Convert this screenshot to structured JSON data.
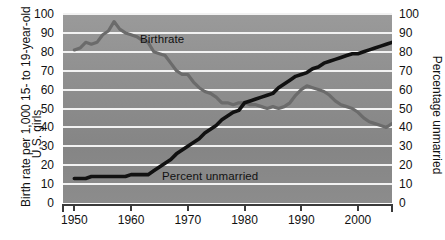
{
  "chart_data": {
    "type": "line",
    "title": "",
    "xlabel": "",
    "ylabel": "Birth rate per 1,000 15- to 19-year-old U.S. girls",
    "ylabel_line1": "Birth rate per 1,000 15- to 19-year-old",
    "ylabel_line2": "U.S. girls",
    "y2label": "Percentage unmarried",
    "xlim": [
      1948,
      2006
    ],
    "ylim": [
      0,
      100
    ],
    "y2lim": [
      0,
      100
    ],
    "grid": true,
    "legend_position": "inline",
    "xticks": [
      1950,
      1960,
      1970,
      1980,
      1990,
      2000
    ],
    "yticks": [
      0,
      10,
      20,
      30,
      40,
      50,
      60,
      70,
      80,
      90,
      100
    ],
    "y2ticks": [
      0,
      10,
      20,
      30,
      40,
      50,
      60,
      70,
      80,
      90,
      100
    ],
    "series": [
      {
        "name": "Birthrate",
        "color": "#6b6b6b",
        "axis": "left",
        "x": [
          1950,
          1951,
          1952,
          1953,
          1954,
          1955,
          1956,
          1957,
          1958,
          1959,
          1960,
          1961,
          1962,
          1963,
          1964,
          1965,
          1966,
          1967,
          1968,
          1969,
          1970,
          1971,
          1972,
          1973,
          1974,
          1975,
          1976,
          1977,
          1978,
          1979,
          1980,
          1981,
          1982,
          1983,
          1984,
          1985,
          1986,
          1987,
          1988,
          1989,
          1990,
          1991,
          1992,
          1993,
          1994,
          1995,
          1996,
          1997,
          1998,
          1999,
          2000,
          2001,
          2002,
          2003,
          2004,
          2005,
          2006
        ],
        "values": [
          81,
          82,
          85,
          84,
          85,
          89,
          91,
          96,
          92,
          90,
          89,
          88,
          86,
          85,
          80,
          79,
          78,
          74,
          70,
          68,
          68,
          64,
          61,
          59,
          58,
          56,
          53,
          53,
          52,
          53,
          53,
          52,
          52,
          51,
          50,
          51,
          50,
          51,
          53,
          57,
          60,
          62,
          61,
          60,
          59,
          57,
          54,
          52,
          51,
          50,
          48,
          45,
          43,
          42,
          41,
          40,
          42
        ]
      },
      {
        "name": "Percent unmarried",
        "color": "#111111",
        "axis": "right",
        "x": [
          1950,
          1951,
          1952,
          1953,
          1954,
          1955,
          1956,
          1957,
          1958,
          1959,
          1960,
          1961,
          1962,
          1963,
          1964,
          1965,
          1966,
          1967,
          1968,
          1969,
          1970,
          1971,
          1972,
          1973,
          1974,
          1975,
          1976,
          1977,
          1978,
          1979,
          1980,
          1981,
          1982,
          1983,
          1984,
          1985,
          1986,
          1987,
          1988,
          1989,
          1990,
          1991,
          1992,
          1993,
          1994,
          1995,
          1996,
          1997,
          1998,
          1999,
          2000,
          2001,
          2002,
          2003,
          2004,
          2005,
          2006
        ],
        "values": [
          13,
          13,
          13,
          14,
          14,
          14,
          14,
          14,
          14,
          14,
          15,
          15,
          15,
          15,
          17,
          19,
          21,
          23,
          26,
          28,
          30,
          32,
          34,
          37,
          39,
          41,
          44,
          46,
          48,
          49,
          53,
          54,
          55,
          56,
          57,
          58,
          61,
          63,
          65,
          67,
          68,
          69,
          71,
          72,
          74,
          75,
          76,
          77,
          78,
          79,
          79,
          80,
          81,
          82,
          83,
          84,
          85
        ]
      }
    ],
    "annotations": [
      {
        "text": "Birthrate",
        "x": 1963,
        "y": 82
      },
      {
        "text": "Percent unmarried",
        "x": 1967,
        "y": 18
      }
    ]
  },
  "labels": {
    "birthrate": "Birthrate",
    "percent_unmarried": "Percent unmarried"
  }
}
